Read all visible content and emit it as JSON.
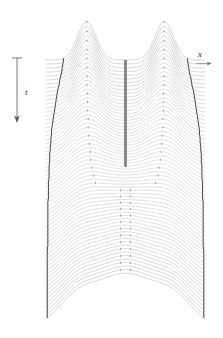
{
  "figure": {
    "type": "waterfall-wave-evolution-plot",
    "background_color": "#ffffff",
    "trace_color": "#b9b9b9",
    "envelope_color": "#3a3a3a",
    "axis_color": "#555555",
    "width": 223,
    "height": 338
  },
  "axes": {
    "time_axis": {
      "label": "t",
      "direction": "downward",
      "arrow_name": "time-arrow",
      "x": 17,
      "y_top": 58,
      "y_bottom": 122
    },
    "space_axis": {
      "label": "x",
      "direction": "rightward",
      "arrow_name": "space-arrow",
      "x_start": 196,
      "x_end": 212,
      "y": 64
    }
  },
  "chart_data": {
    "type": "line",
    "title": "",
    "xlabel": "x",
    "ylabel": "t",
    "subtitle": "",
    "grid": false,
    "legend": null,
    "plot_box": {
      "left": 46,
      "right": 205,
      "top": 60,
      "bottom": 320
    },
    "n_traces": 66,
    "trace_spacing_px": 4,
    "baseline_x_range": [
      46,
      205
    ],
    "x": [
      0,
      0.0625,
      0.125,
      0.1875,
      0.25,
      0.3125,
      0.375,
      0.4375,
      0.5,
      0.5625,
      0.625,
      0.6875,
      0.75,
      0.8125,
      0.875,
      0.9375,
      1
    ],
    "series": [
      {
        "name": "trace-0 (t=0)",
        "values": [
          0,
          0.02,
          0.06,
          0.3,
          0.86,
          0.55,
          0.12,
          0.02,
          0.0,
          0.02,
          0.12,
          0.55,
          0.86,
          0.3,
          0.06,
          0.02,
          0
        ]
      },
      {
        "name": "trace-16 (t=0.24)",
        "values": [
          0,
          0.05,
          0.18,
          0.52,
          0.78,
          0.48,
          0.14,
          0.03,
          0.01,
          0.03,
          0.14,
          0.48,
          0.78,
          0.52,
          0.18,
          0.05,
          0
        ]
      },
      {
        "name": "trace-33 (t=0.5)",
        "values": [
          0.01,
          0.12,
          0.35,
          0.58,
          0.62,
          0.42,
          0.2,
          0.1,
          0.08,
          0.1,
          0.2,
          0.42,
          0.62,
          0.58,
          0.35,
          0.12,
          0.01
        ]
      },
      {
        "name": "trace-50 (t=0.76)",
        "values": [
          0.02,
          0.2,
          0.4,
          0.5,
          0.48,
          0.4,
          0.32,
          0.28,
          0.27,
          0.28,
          0.32,
          0.4,
          0.48,
          0.5,
          0.4,
          0.2,
          0.02
        ]
      },
      {
        "name": "trace-65 (t=1)",
        "values": [
          0.0,
          0.1,
          0.3,
          0.46,
          0.55,
          0.6,
          0.63,
          0.64,
          0.64,
          0.64,
          0.63,
          0.6,
          0.55,
          0.46,
          0.3,
          0.1,
          0.0
        ]
      }
    ],
    "envelopes": [
      {
        "name": "left-outer-envelope",
        "description": "dark curve tracing left edge of wave support, bulging leftward with time"
      },
      {
        "name": "right-outer-envelope",
        "description": "dark curve tracing right edge of wave support, bulging rightward with time"
      },
      {
        "name": "central-trough-envelope",
        "description": "narrow V-shaped dark notch between the two crests, closing near t=0.47"
      }
    ],
    "crest_markers": {
      "name": "crest-tick-marks",
      "description": "small tick marks on each trace marking the local crest positions",
      "left_crest_x": 0.25,
      "right_crest_x": 0.75
    },
    "xlim": [
      0,
      1
    ],
    "ylim": [
      0,
      1
    ]
  }
}
